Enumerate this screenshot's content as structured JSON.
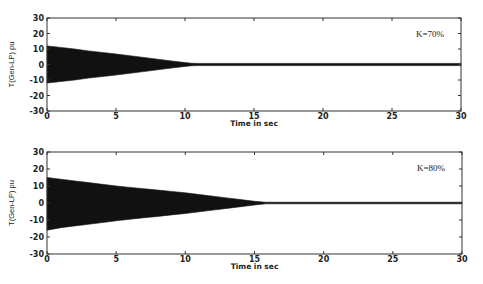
{
  "chart_data": [
    {
      "type": "area",
      "title": "",
      "annotation": "K=70%",
      "xlabel": "Time in sec",
      "ylabel": "T(Gen-LP) pu",
      "xlim": [
        0,
        30
      ],
      "ylim": [
        -30,
        30
      ],
      "xticks": [
        "0",
        "5",
        "10",
        "15",
        "20",
        "25",
        "30"
      ],
      "yticks": [
        "30",
        "20",
        "10",
        "0",
        "-10",
        "-20",
        "-30"
      ],
      "grid": false,
      "description": "Decaying oscillation envelope of torque, dense oscillations filling band",
      "envelope": {
        "t": [
          0,
          1,
          2,
          3,
          4,
          5,
          6,
          7,
          8,
          9,
          10,
          10.5,
          11,
          15,
          20,
          25,
          30
        ],
        "upper": [
          12,
          11,
          10,
          8.8,
          7.8,
          6.8,
          5.7,
          4.6,
          3.4,
          2.3,
          1.2,
          0.8,
          0.7,
          0.7,
          0.7,
          0.7,
          0.7
        ],
        "lower": [
          -12,
          -11,
          -10,
          -8.8,
          -7.8,
          -6.8,
          -5.7,
          -4.6,
          -3.4,
          -2.3,
          -1.2,
          -0.8,
          -0.7,
          -0.7,
          -0.7,
          -0.7,
          -0.7
        ]
      }
    },
    {
      "type": "area",
      "title": "",
      "annotation": "K=80%",
      "xlabel": "Time in sec",
      "ylabel": "T(Gen-LP) pu",
      "xlim": [
        0,
        30
      ],
      "ylim": [
        -30,
        30
      ],
      "xticks": [
        "0",
        "5",
        "10",
        "15",
        "20",
        "25",
        "30"
      ],
      "yticks": [
        "30",
        "20",
        "10",
        "0",
        "-10",
        "-20",
        "-30"
      ],
      "grid": false,
      "description": "Decaying oscillation envelope of torque, dense oscillations filling band",
      "envelope": {
        "t": [
          0,
          1,
          2,
          3,
          4,
          5,
          6,
          7,
          8,
          9,
          10,
          11,
          12,
          13,
          14,
          15,
          15.8,
          20,
          25,
          30
        ],
        "upper": [
          15,
          14,
          13,
          12,
          11,
          10,
          9.2,
          8.4,
          7.6,
          6.8,
          6,
          5,
          4,
          3,
          2,
          1,
          0.5,
          0.5,
          0.5,
          0.5
        ],
        "lower": [
          -16,
          -14.5,
          -13.5,
          -12.5,
          -11.5,
          -10.5,
          -9.5,
          -8.7,
          -7.9,
          -7,
          -6.2,
          -5.2,
          -4.2,
          -3.2,
          -2.2,
          -1.2,
          -0.5,
          -0.5,
          -0.5,
          -0.5
        ]
      }
    }
  ],
  "plots": [
    {
      "annotation": "K=70%",
      "xlabel": "Time in sec",
      "ylabel": "T(Gen-LP) pu"
    },
    {
      "annotation": "K=80%",
      "xlabel": "Time in sec",
      "ylabel": "T(Gen-LP) pu"
    }
  ]
}
